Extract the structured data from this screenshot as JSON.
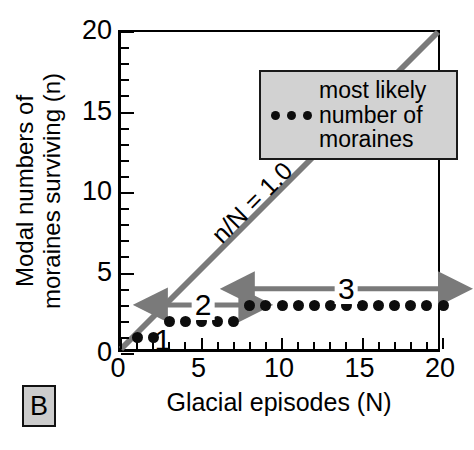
{
  "panel": {
    "label": "B"
  },
  "chart_data": {
    "type": "scatter",
    "title": "",
    "xlabel": "Glacial episodes (N)",
    "ylabel": "Modal numbers of moraines surviving (n)",
    "ylabel_lines": [
      "Modal numbers of",
      "moraines surviving (n)"
    ],
    "xlim": [
      0,
      20
    ],
    "ylim": [
      0,
      20
    ],
    "grid": false,
    "xticks_major": [
      0,
      5,
      10,
      15,
      20
    ],
    "xticks_major_labels": [
      "0",
      "5",
      "10",
      "15",
      "20"
    ],
    "xticks_minor": [
      1,
      2,
      3,
      4,
      6,
      7,
      8,
      9,
      11,
      12,
      13,
      14,
      16,
      17,
      18,
      19
    ],
    "yticks_major": [
      0,
      5,
      10,
      15,
      20
    ],
    "yticks_major_labels": [
      "0",
      "5",
      "10",
      "15",
      "20"
    ],
    "yticks_minor": [
      1,
      2,
      3,
      4,
      6,
      7,
      8,
      9,
      11,
      12,
      13,
      14,
      16,
      17,
      18,
      19
    ],
    "series": [
      {
        "name": "most likely number of moraines",
        "marker": "filled-circle",
        "color": "#0d0d0d",
        "x": [
          1,
          2,
          3,
          4,
          5,
          6,
          7,
          8,
          9,
          10,
          11,
          12,
          13,
          14,
          15,
          16,
          17,
          18,
          19,
          20
        ],
        "y": [
          1,
          1,
          2,
          2,
          2,
          2,
          2,
          3,
          3,
          3,
          3,
          3,
          3,
          3,
          3,
          3,
          3,
          3,
          3,
          3
        ]
      }
    ],
    "reference_line": {
      "label": "n/N = 1.0",
      "color": "#7a7a7a",
      "from": [
        0,
        0
      ],
      "to": [
        20,
        20
      ],
      "label_position": [
        8.2,
        8.2
      ]
    },
    "annotations": [
      {
        "label": "1",
        "type": "text",
        "position": [
          2.6,
          0.85
        ],
        "color": "#000000"
      },
      {
        "label": "2",
        "type": "double-arrow",
        "from": [
          2.6,
          3.05
        ],
        "to": [
          7.6,
          3.05
        ],
        "label_position": [
          5.1,
          3.05
        ],
        "color": "#7a7a7a"
      },
      {
        "label": "3",
        "type": "double-arrow",
        "from": [
          8.0,
          4.05
        ],
        "to": [
          20.0,
          4.05
        ],
        "label_position": [
          14.0,
          4.05
        ],
        "color": "#7a7a7a"
      }
    ],
    "legend": {
      "position": "upper-left-inset",
      "background": "#d2d2d2",
      "border": "#1a1a1a",
      "marker_count": 3,
      "entry_lines": [
        "most likely",
        "number of",
        "moraines"
      ]
    }
  }
}
